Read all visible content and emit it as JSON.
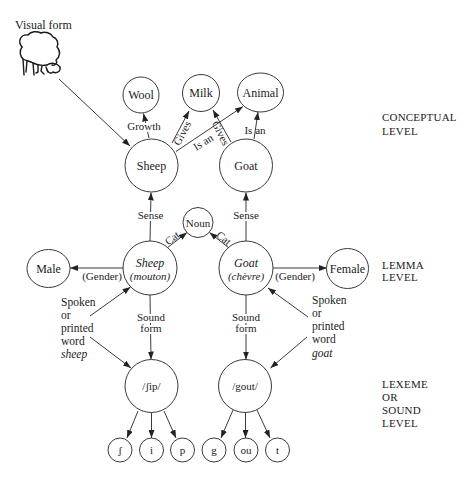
{
  "diagram": {
    "visual_input": {
      "label": "Visual form",
      "icon": "sheep-drawing"
    },
    "levels": {
      "conceptual": [
        "CONCEPTUAL",
        "LEVEL"
      ],
      "lemma": [
        "LEMMA",
        "LEVEL"
      ],
      "lexeme": [
        "LEXEME",
        "OR",
        "SOUND",
        "LEVEL"
      ]
    },
    "nodes": {
      "wool": "Wool",
      "milk": "Milk",
      "animal": "Animal",
      "sheep_concept": "Sheep",
      "goat_concept": "Goat",
      "noun": "Noun",
      "male": "Male",
      "female": "Female",
      "sheep_lemma": [
        "Sheep",
        "(mouton)"
      ],
      "goat_lemma": [
        "Goat",
        "(chèvre)"
      ],
      "sheep_lexeme": "/ʃip/",
      "goat_lexeme": "/gout/",
      "sheep_phonemes": [
        "ʃ",
        "i",
        "p"
      ],
      "goat_phonemes": [
        "g",
        "ou",
        "t"
      ]
    },
    "edge_labels": {
      "growth": "Growth",
      "sheep_gives": "Gives",
      "sheep_is_an": "Is an",
      "goat_gives": "Gives",
      "goat_is_an": "Is an",
      "sheep_sense": "Sense",
      "goat_sense": "Sense",
      "sheep_cat": "Cat",
      "goat_cat": "Cat",
      "male_gender": "(Gender)",
      "female_gender": "(Gender)",
      "sheep_sound_form": [
        "Sound",
        "form"
      ],
      "goat_sound_form": [
        "Sound",
        "form"
      ]
    },
    "word_inputs": {
      "sheep": {
        "lines": [
          "Spoken",
          "or",
          "printed",
          "word"
        ],
        "word": "sheep"
      },
      "goat": {
        "lines": [
          "Spoken",
          "or",
          "printed",
          "word"
        ],
        "word": "goat"
      }
    },
    "edges": [
      {
        "from": "Visual form",
        "to": "Sheep",
        "label": ""
      },
      {
        "from": "Sheep",
        "to": "Wool",
        "label": "Growth"
      },
      {
        "from": "Sheep",
        "to": "Milk",
        "label": "Gives"
      },
      {
        "from": "Sheep",
        "to": "Animal",
        "label": "Is an"
      },
      {
        "from": "Goat",
        "to": "Milk",
        "label": "Gives"
      },
      {
        "from": "Goat",
        "to": "Animal",
        "label": "Is an"
      },
      {
        "from": "Sheep (mouton)",
        "to": "Sheep",
        "label": "Sense"
      },
      {
        "from": "Goat (chèvre)",
        "to": "Goat",
        "label": "Sense"
      },
      {
        "from": "Sheep (mouton)",
        "to": "Noun",
        "label": "Cat"
      },
      {
        "from": "Goat (chèvre)",
        "to": "Noun",
        "label": "Cat"
      },
      {
        "from": "Sheep (mouton)",
        "to": "Male",
        "label": "(Gender)"
      },
      {
        "from": "Goat (chèvre)",
        "to": "Female",
        "label": "(Gender)"
      },
      {
        "from": "Spoken or printed word sheep",
        "to": "Sheep (mouton)",
        "label": ""
      },
      {
        "from": "Spoken or printed word sheep",
        "to": "/ʃip/",
        "label": ""
      },
      {
        "from": "Sheep (mouton)",
        "to": "/ʃip/",
        "label": "Sound form"
      },
      {
        "from": "Spoken or printed word goat",
        "to": "Goat (chèvre)",
        "label": ""
      },
      {
        "from": "Spoken or printed word goat",
        "to": "/gout/",
        "label": ""
      },
      {
        "from": "Goat (chèvre)",
        "to": "/gout/",
        "label": "Sound form"
      },
      {
        "from": "/ʃip/",
        "to": "ʃ",
        "label": ""
      },
      {
        "from": "/ʃip/",
        "to": "i",
        "label": ""
      },
      {
        "from": "/ʃip/",
        "to": "p",
        "label": ""
      },
      {
        "from": "/gout/",
        "to": "g",
        "label": ""
      },
      {
        "from": "/gout/",
        "to": "ou",
        "label": ""
      },
      {
        "from": "/gout/",
        "to": "t",
        "label": ""
      }
    ]
  }
}
